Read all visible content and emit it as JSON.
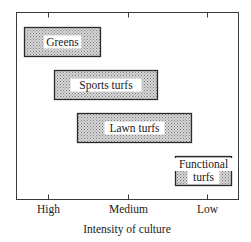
{
  "chart_data": {
    "type": "range-bar",
    "title": "",
    "xlabel": "Intensity of culture",
    "ylabel": "",
    "x_ticks": [
      "High",
      "Medium",
      "Low"
    ],
    "x_scale": {
      "High": 0,
      "Medium": 1,
      "Low": 2
    },
    "xlim": [
      -0.4,
      2.4
    ],
    "grid": false,
    "legend": "none",
    "bars": [
      {
        "label": [
          "Greens"
        ],
        "start": -0.3,
        "end": 0.65
      },
      {
        "label": [
          "Sports turfs"
        ],
        "start": 0.08,
        "end": 1.38
      },
      {
        "label": [
          "Lawn turfs"
        ],
        "start": 0.36,
        "end": 1.8
      },
      {
        "label": [
          "Functional",
          "turfs"
        ],
        "start": 1.6,
        "end": 2.3
      }
    ],
    "fill": "#b8b8b8",
    "edge": "#2a2a2a"
  }
}
